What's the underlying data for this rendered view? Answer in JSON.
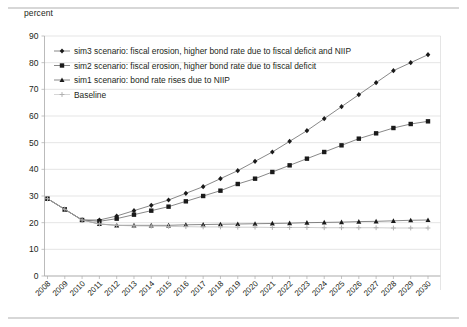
{
  "axis_unit_label": "percent",
  "legend": {
    "entries": [
      {
        "label": "sim3 scenario: fiscal erosion, higher bond rate due to fiscal deficit and NIIP",
        "marker": "diamond-marker-icon",
        "color": "#1a1a1a"
      },
      {
        "label": "sim2 scenario: fiscal erosion, higher bond rate due to fiscal deficit",
        "marker": "square-marker-icon",
        "color": "#1a1a1a"
      },
      {
        "label": "sim1 scenario: bond rate rises due to NIIP",
        "marker": "triangle-marker-icon",
        "color": "#1a1a1a"
      },
      {
        "label": "Baseline",
        "marker": "plus-marker-icon",
        "color": "#b0b0b0"
      }
    ]
  },
  "chart_data": {
    "type": "line",
    "title": "",
    "subtitle": "",
    "xlabel": "",
    "ylabel": "percent",
    "ylim": [
      0,
      90
    ],
    "yticks": [
      0,
      10,
      20,
      30,
      40,
      50,
      60,
      70,
      80,
      90
    ],
    "grid": true,
    "legend_position": "top-left-inside",
    "categories": [
      "2008",
      "2009",
      "2010",
      "2011",
      "2012",
      "2013",
      "2014",
      "2015",
      "2016",
      "2017",
      "2018",
      "2019",
      "2020",
      "2021",
      "2022",
      "2023",
      "2024",
      "2025",
      "2026",
      "2027",
      "2028",
      "2029",
      "2030"
    ],
    "series": [
      {
        "name": "sim3 scenario: fiscal erosion, higher bond rate due to fiscal deficit and NIIP",
        "marker": "diamond",
        "values": [
          29,
          25,
          21,
          21,
          22.5,
          24.5,
          26.5,
          28.5,
          31,
          33.5,
          36.5,
          39.5,
          43,
          46.5,
          50.5,
          54.5,
          59,
          63.5,
          68,
          72.5,
          77,
          80,
          83
        ]
      },
      {
        "name": "sim2 scenario: fiscal erosion, higher bond rate due to fiscal deficit",
        "marker": "square",
        "values": [
          29,
          25,
          21,
          20.5,
          21.5,
          23,
          24.5,
          26,
          28,
          30,
          32,
          34.5,
          36.5,
          39,
          41.5,
          44,
          46.5,
          49,
          51.5,
          53.5,
          55.5,
          57,
          58
        ]
      },
      {
        "name": "sim1 scenario: bond rate rises due to NIIP",
        "marker": "triangle",
        "values": [
          29,
          25,
          21,
          19.5,
          19,
          19,
          19,
          19,
          19.2,
          19.3,
          19.4,
          19.5,
          19.6,
          19.7,
          19.8,
          20,
          20.1,
          20.2,
          20.4,
          20.5,
          20.7,
          20.9,
          21
        ]
      },
      {
        "name": "Baseline",
        "marker": "plus",
        "values": [
          29,
          25,
          21,
          19.5,
          19,
          18.8,
          18.7,
          18.6,
          18.5,
          18.4,
          18.4,
          18.3,
          18.3,
          18.2,
          18.2,
          18.2,
          18.1,
          18.1,
          18.1,
          18.1,
          18.0,
          18.0,
          18.0
        ]
      }
    ]
  }
}
